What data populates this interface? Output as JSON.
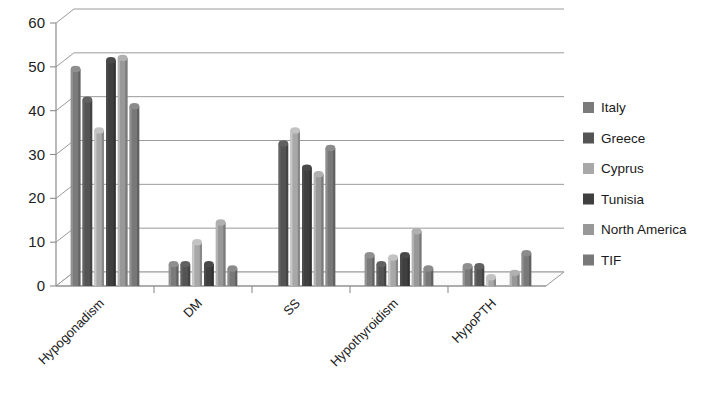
{
  "chart_data": {
    "type": "bar",
    "title": "",
    "subtitle": "",
    "xlabel": "",
    "ylabel": "",
    "ylim": [
      0,
      60
    ],
    "yticks": [
      0,
      10,
      20,
      30,
      40,
      50,
      60
    ],
    "ytick_labels": [
      "0",
      "10",
      "20",
      "30",
      "40",
      "50",
      "60"
    ],
    "grid": true,
    "grid_axis": "y",
    "legend_position": "right",
    "style": "3d-grouped-column",
    "categories": [
      "Hypogonadism",
      "DM",
      "SS",
      "Hypothyroidism",
      "HypoPTH"
    ],
    "series": [
      {
        "name": "Italy",
        "color": "#7b7b7b",
        "values": [
          49.5,
          5.0,
          0.0,
          7.0,
          4.5
        ]
      },
      {
        "name": "Greece",
        "color": "#545454",
        "values": [
          42.5,
          5.0,
          32.5,
          5.0,
          4.5
        ]
      },
      {
        "name": "Cyprus",
        "color": "#a8a8a8",
        "values": [
          35.5,
          10.0,
          35.5,
          6.5,
          2.0
        ]
      },
      {
        "name": "Tunisia",
        "color": "#3f3f3f",
        "values": [
          51.5,
          5.0,
          27.0,
          7.0,
          0.0
        ]
      },
      {
        "name": "North America",
        "color": "#989898",
        "values": [
          52.0,
          14.5,
          25.5,
          12.5,
          3.0
        ]
      },
      {
        "name": "TIF",
        "color": "#787878",
        "values": [
          41.0,
          4.0,
          31.5,
          4.0,
          7.5
        ]
      }
    ]
  },
  "legend": {
    "items": [
      {
        "label": "Italy",
        "swatch": "#7b7b7b"
      },
      {
        "label": "Greece",
        "swatch": "#545454"
      },
      {
        "label": "Cyprus",
        "swatch": "#a8a8a8"
      },
      {
        "label": "Tunisia",
        "swatch": "#3f3f3f"
      },
      {
        "label": "North America",
        "swatch": "#989898"
      },
      {
        "label": "TIF",
        "swatch": "#787878"
      }
    ]
  },
  "axes": {
    "y_tick_labels": [
      "60",
      "50",
      "40",
      "30",
      "20",
      "10",
      "0"
    ],
    "x_category_labels": [
      "Hypogonadism",
      "DM",
      "SS",
      "Hypothyroidism",
      "HypoPTH"
    ]
  }
}
